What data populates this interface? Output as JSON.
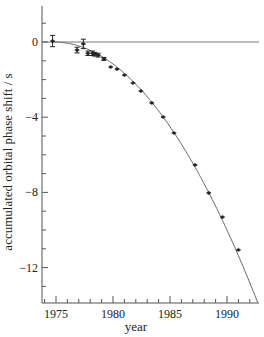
{
  "chart_data": {
    "type": "scatter",
    "title": "",
    "xlabel": "year",
    "ylabel": "accumulated orbital phase shift / s",
    "xlim": [
      1973.5,
      1993
    ],
    "ylim": [
      -14,
      2
    ],
    "x_major_ticks": [
      1975,
      1980,
      1985,
      1990
    ],
    "x_tick_labels": [
      "1975",
      "1980",
      "1985",
      "1990"
    ],
    "x_minor_step": 1,
    "y_major_ticks": [
      0,
      -4,
      -8,
      -12
    ],
    "y_tick_labels": [
      "0",
      "−4",
      "−8",
      "−12"
    ],
    "y_minor_step": 1,
    "grid": false,
    "legend": null,
    "reference_line": {
      "y": 0,
      "label": ""
    },
    "series": [
      {
        "name": "observed",
        "kind": "points_with_error_bars",
        "x": [
          1974.7,
          1976.85,
          1977.4,
          1977.8,
          1978.2,
          1978.4,
          1978.7,
          1979.2,
          1979.8,
          1980.35,
          1981.0,
          1981.75,
          1982.45,
          1983.4,
          1984.4,
          1985.35,
          1987.2,
          1988.4,
          1989.6,
          1991.0
        ],
        "y": [
          0.05,
          -0.43,
          -0.1,
          -0.6,
          -0.6,
          -0.65,
          -0.7,
          -0.9,
          -1.33,
          -1.44,
          -1.76,
          -2.18,
          -2.61,
          -3.24,
          -3.99,
          -4.84,
          -6.54,
          -8.03,
          -9.31,
          -11.06
        ],
        "yerr": [
          0.3,
          0.15,
          0.25,
          0.12,
          0.12,
          0.1,
          0.1,
          0.08,
          0.06,
          0.06,
          0.05,
          0.05,
          0.05,
          0.05,
          0.05,
          0.05,
          0.05,
          0.05,
          0.05,
          0.05
        ]
      },
      {
        "name": "general relativity prediction",
        "kind": "curve",
        "equation": "y = -a * (t - 1974.8)^2",
        "t0": 1974.8,
        "a": 0.0433,
        "x_end": 1992.7
      }
    ]
  },
  "colors": {
    "axis": "#555555",
    "curve": "#666666",
    "points": "#222222",
    "zero_line": "#777777"
  }
}
